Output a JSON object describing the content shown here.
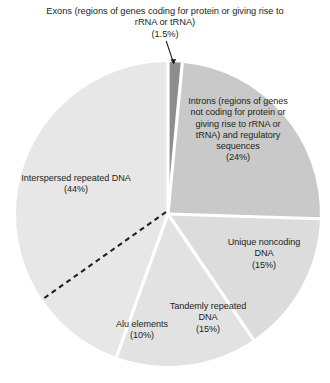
{
  "chart_data": {
    "type": "pie",
    "title": "",
    "subtitle": "",
    "xlabel": "",
    "ylabel": "",
    "legend_position": "none",
    "grid": false,
    "units": "percent",
    "total": 100,
    "start_angle_deg": 0,
    "direction": "clockwise",
    "center": {
      "x": 168,
      "y": 214
    },
    "radius": 152,
    "categories": [
      "Exons (regions of genes coding for protein or giving rise to rRNA or tRNA)",
      "Introns (regions of genes not coding for protein or giving rise to rRNA or tRNA) and regulatory sequences",
      "Unique noncoding DNA",
      "Tandemly repeated DNA",
      "Interspersed repeated DNA"
    ],
    "values": [
      1.5,
      24,
      15,
      15,
      44
    ],
    "sub_slices": [
      {
        "name": "Alu elements",
        "value": 10,
        "parent": "Interspersed repeated DNA",
        "boundary": "dashed"
      }
    ],
    "slices": [
      {
        "id": "exons",
        "name": "Exons",
        "value": 1.5,
        "value_label": "(1.5%)",
        "color": "#8d8d8d",
        "start_deg": 0,
        "end_deg": 5.4,
        "label_lines": [
          "Exons (regions of genes coding for",
          "protein or giving rise to rRNA or tRNA)"
        ],
        "leader_line": true
      },
      {
        "id": "introns",
        "name": "Introns",
        "value": 24,
        "value_label": "(24%)",
        "color": "#c9c9c9",
        "start_deg": 5.4,
        "end_deg": 91.8,
        "label_lines": [
          "Introns (regions",
          "of genes not coding",
          "for protein or giving",
          "rise to rRNA or tRNA)",
          "and regulatory",
          "sequences"
        ],
        "leader_line": false
      },
      {
        "id": "unique-noncoding",
        "name": "Unique noncoding DNA",
        "value": 15,
        "value_label": "(15%)",
        "color": "#dcdcdc",
        "start_deg": 91.8,
        "end_deg": 145.8,
        "label_lines": [
          "Unique",
          "noncoding",
          "DNA"
        ],
        "leader_line": false
      },
      {
        "id": "tandemly-repeated",
        "name": "Tandemly repeated DNA",
        "value": 15,
        "value_label": "(15%)",
        "color": "#e2e2e2",
        "start_deg": 145.8,
        "end_deg": 199.8,
        "label_lines": [
          "Tandemly",
          "repeated DNA"
        ],
        "leader_line": false
      },
      {
        "id": "interspersed-repeated",
        "name": "Interspersed repeated DNA",
        "value": 44,
        "value_label": "(44%)",
        "color": "#e7e7e7",
        "start_deg": 199.8,
        "end_deg": 360,
        "label_lines": [
          "Interspersed",
          "repeated DNA"
        ],
        "leader_line": false
      },
      {
        "id": "alu-elements",
        "name": "Alu elements",
        "value": 10,
        "value_label": "(10%)",
        "color": "#e7e7e7",
        "start_deg": 199.8,
        "end_deg": 235.8,
        "label_lines": [
          "Alu elements"
        ],
        "leader_line": false
      }
    ]
  },
  "labels": {
    "exons": {
      "line1": "Exons (regions of genes coding for",
      "line2": "protein or giving rise to rRNA or tRNA)",
      "pct": "(1.5%)"
    },
    "introns": {
      "line1": "Introns (regions",
      "line2": "of genes not coding",
      "line3": "for protein or giving",
      "line4": "rise to rRNA or tRNA)",
      "line5": "and regulatory",
      "line6": "sequences",
      "pct": "(24%)"
    },
    "unique": {
      "line1": "Unique",
      "line2": "noncoding",
      "line3": "DNA",
      "pct": "(15%)"
    },
    "tandem": {
      "line1": "Tandemly",
      "line2": "repeated DNA",
      "pct": "(15%)"
    },
    "alu": {
      "line1": "Alu elements",
      "pct": "(10%)"
    },
    "interspersed": {
      "line1": "Interspersed",
      "line2": "repeated DNA",
      "pct": "(44%)"
    }
  },
  "colors": {
    "background": "#ffffff",
    "text": "#231f20",
    "exons_slice": "#8d8d8d",
    "introns_slice": "#c9c9c9",
    "unique_slice": "#dcdcdc",
    "tandem_slice": "#e2e2e2",
    "interspersed_slice": "#e7e7e7",
    "slice_gap": "#ffffff",
    "dashed_divider": "#231f20",
    "leader_line": "#231f20"
  }
}
